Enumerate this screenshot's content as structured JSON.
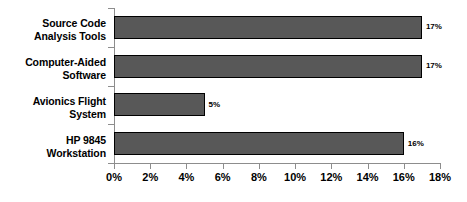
{
  "chart_data": {
    "type": "bar",
    "orientation": "horizontal",
    "title": "",
    "xlabel": "",
    "ylabel": "",
    "categories": [
      "Source Code Analysis Tools",
      "Computer-Aided Software",
      "Avionics Flight System",
      "HP 9845 Workstation"
    ],
    "category_lines": [
      [
        "Source Code",
        "Analysis Tools"
      ],
      [
        "Computer-Aided",
        "Software"
      ],
      [
        "Avionics Flight",
        "System"
      ],
      [
        "HP 9845",
        "Workstation"
      ]
    ],
    "values": [
      17,
      17,
      5,
      16
    ],
    "data_labels": [
      "17%",
      "17%",
      "5%",
      "16%"
    ],
    "xlim": [
      0,
      18
    ],
    "xticks": [
      0,
      2,
      4,
      6,
      8,
      10,
      12,
      14,
      16,
      18
    ],
    "xtick_labels": [
      "0%",
      "2%",
      "4%",
      "6%",
      "8%",
      "10%",
      "12%",
      "14%",
      "16%",
      "18%"
    ],
    "grid": false,
    "legend": null,
    "colors": {
      "bar_fill": "#585858",
      "bar_border": "#000000",
      "axis": "#8d8d8d",
      "text": "#000000",
      "background": "#ffffff"
    }
  }
}
